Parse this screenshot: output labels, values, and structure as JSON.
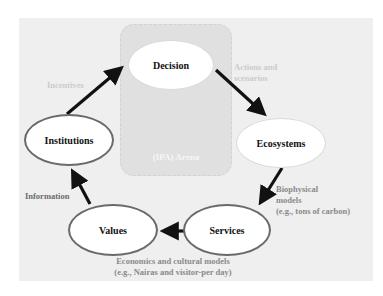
{
  "diagram": {
    "arena_label": "(IPA) Arena",
    "nodes": {
      "decision": "Decision",
      "ecosystems": "Ecosystems",
      "services": "Services",
      "values": "Values",
      "institutions": "Institutions"
    },
    "edges": [
      {
        "from": "institutions",
        "to": "decision",
        "label": "Incentives"
      },
      {
        "from": "decision",
        "to": "ecosystems",
        "label": "Actions and scenarios"
      },
      {
        "from": "ecosystems",
        "to": "services",
        "label": "Biophysical models (e.g., tons of carbon)"
      },
      {
        "from": "services",
        "to": "values",
        "label": "Economics and cultural models (e.g., Nairas and visitor-per day)"
      },
      {
        "from": "values",
        "to": "institutions",
        "label": "Information"
      }
    ],
    "labels": {
      "incentives": "Incentives",
      "actions_line1": "Actions and",
      "actions_line2": "scenarios",
      "biophysical_line1": "Biophysical",
      "biophysical_line2": "models",
      "biophysical_line3": "(e.g., tons of carbon)",
      "economics_line1": "Economics and cultural models",
      "economics_line2": "(e.g., Nairas and visitor-per day)",
      "information": "Information"
    },
    "colors": {
      "panel": "#efefef",
      "arena": "#e0e0e0",
      "arrow": "#111111",
      "node_border": "#6a6a6a"
    }
  }
}
